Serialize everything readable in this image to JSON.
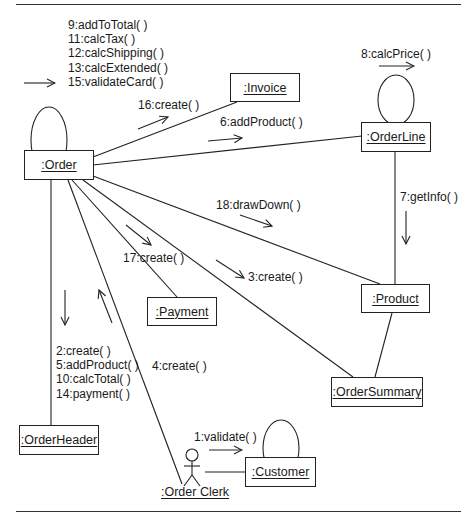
{
  "diagram": {
    "type": "UML communication diagram",
    "objects": {
      "order": ":Order",
      "invoice": ":Invoice",
      "orderline": ":OrderLine",
      "product": ":Product",
      "payment": ":Payment",
      "ordersummary": ":OrderSummary",
      "orderheader": ":OrderHeader",
      "customer": ":Customer",
      "orderclerk": ":Order Clerk"
    },
    "messages": {
      "order_self": [
        "9:addToTotal( )",
        "11:calcTax( )",
        "12:calcShipping( )",
        "13:calcExtended( )",
        "15:validateCard( )"
      ],
      "order_to_invoice": "16:create( )",
      "order_to_orderline": "6:addProduct( )",
      "orderline_self": "8:calcPrice( )",
      "orderline_to_product": "7:getInfo( )",
      "order_to_product": "18:drawDown( )",
      "order_to_payment": "17:create( )",
      "order_to_ordersummary": "3:create( )",
      "order_to_orderheader": [
        "2:create( )",
        "5:addProduct( )",
        "10:calcTotal( )",
        "14:payment( )"
      ],
      "clerk_to_order": "4:create( )",
      "clerk_to_customer": "1:validate( )"
    },
    "colors": {
      "line": "#222222",
      "text": "#1a1a1a",
      "background": "#ffffff"
    }
  }
}
